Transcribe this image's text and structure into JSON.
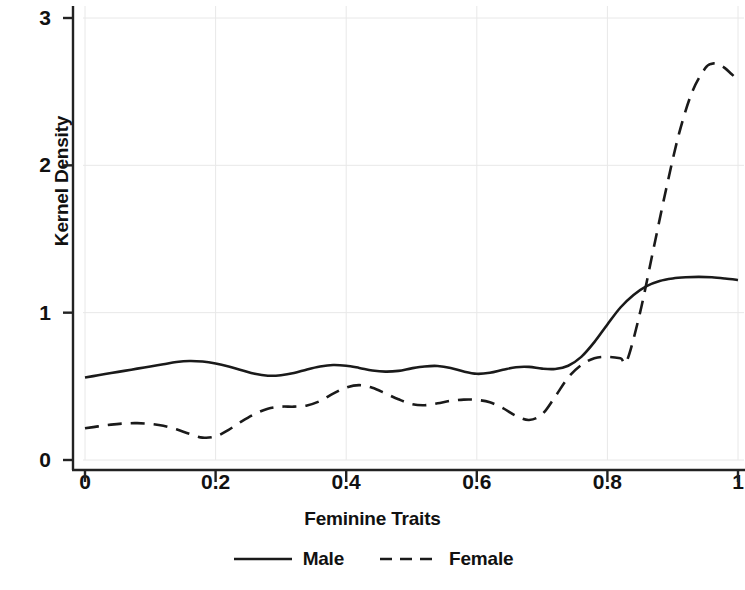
{
  "chart_data": {
    "type": "line",
    "title": "",
    "xlabel": "Feminine Traits",
    "ylabel": "Kernel Density",
    "xlim": [
      0,
      1
    ],
    "ylim": [
      0,
      3
    ],
    "xticks": [
      "0",
      "0.2",
      "0.4",
      "0.6",
      "0.8",
      "1"
    ],
    "xtick_values": [
      0,
      0.2,
      0.4,
      0.6,
      0.8,
      1
    ],
    "yticks": [
      "0",
      "1",
      "2",
      "3"
    ],
    "ytick_values": [
      0,
      1,
      2,
      3
    ],
    "grid": true,
    "grid_color": "#e8e8e8",
    "legend_position": "below-center",
    "line_color": "#1a1a1a",
    "series": [
      {
        "name": "Male",
        "style": "solid",
        "x": [
          0.0,
          0.02,
          0.04,
          0.06,
          0.08,
          0.1,
          0.12,
          0.14,
          0.16,
          0.18,
          0.2,
          0.22,
          0.24,
          0.26,
          0.28,
          0.3,
          0.32,
          0.34,
          0.36,
          0.38,
          0.4,
          0.42,
          0.44,
          0.46,
          0.48,
          0.5,
          0.52,
          0.54,
          0.56,
          0.58,
          0.6,
          0.62,
          0.64,
          0.66,
          0.68,
          0.7,
          0.72,
          0.74,
          0.76,
          0.78,
          0.8,
          0.82,
          0.84,
          0.86,
          0.88,
          0.9,
          0.92,
          0.94,
          0.96,
          0.98,
          1.0
        ],
        "y": [
          0.56,
          0.575,
          0.59,
          0.605,
          0.62,
          0.635,
          0.65,
          0.665,
          0.672,
          0.668,
          0.655,
          0.635,
          0.61,
          0.585,
          0.572,
          0.575,
          0.59,
          0.615,
          0.635,
          0.645,
          0.64,
          0.625,
          0.608,
          0.6,
          0.605,
          0.622,
          0.635,
          0.638,
          0.625,
          0.6,
          0.585,
          0.592,
          0.612,
          0.63,
          0.632,
          0.62,
          0.618,
          0.64,
          0.7,
          0.8,
          0.92,
          1.035,
          1.12,
          1.18,
          1.215,
          1.232,
          1.24,
          1.243,
          1.24,
          1.232,
          1.222
        ]
      },
      {
        "name": "Female",
        "style": "dashed",
        "x": [
          0.0,
          0.02,
          0.04,
          0.06,
          0.08,
          0.1,
          0.12,
          0.14,
          0.16,
          0.18,
          0.2,
          0.22,
          0.24,
          0.26,
          0.28,
          0.3,
          0.32,
          0.34,
          0.36,
          0.38,
          0.4,
          0.42,
          0.44,
          0.46,
          0.48,
          0.5,
          0.52,
          0.54,
          0.56,
          0.58,
          0.6,
          0.62,
          0.64,
          0.66,
          0.68,
          0.7,
          0.72,
          0.74,
          0.76,
          0.78,
          0.8,
          0.82,
          0.83,
          0.85,
          0.87,
          0.89,
          0.91,
          0.93,
          0.95,
          0.96,
          0.97,
          0.98,
          0.99,
          1.0
        ],
        "y": [
          0.215,
          0.228,
          0.24,
          0.248,
          0.25,
          0.245,
          0.232,
          0.208,
          0.178,
          0.152,
          0.16,
          0.205,
          0.262,
          0.312,
          0.348,
          0.362,
          0.362,
          0.37,
          0.4,
          0.45,
          0.492,
          0.508,
          0.49,
          0.452,
          0.412,
          0.38,
          0.372,
          0.385,
          0.402,
          0.41,
          0.408,
          0.392,
          0.352,
          0.3,
          0.272,
          0.31,
          0.43,
          0.56,
          0.645,
          0.69,
          0.7,
          0.69,
          0.675,
          1.0,
          1.42,
          1.84,
          2.22,
          2.5,
          2.66,
          2.69,
          2.685,
          2.66,
          2.62,
          2.58
        ]
      }
    ]
  },
  "legend": [
    {
      "label": "Male",
      "style": "solid"
    },
    {
      "label": "Female",
      "style": "dashed"
    }
  ]
}
